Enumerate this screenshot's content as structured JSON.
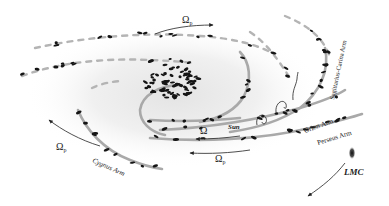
{
  "diagram": {
    "labels": {
      "omega_p_top": "Ω",
      "omega_p_top_sub": "p",
      "omega_p_left": "Ω",
      "omega_p_left_sub": "p",
      "omega_p_bottom": "Ω",
      "omega_p_bottom_sub": "p",
      "omega": "Ω",
      "sun": "Sun",
      "orion_arm": "Orion Arm",
      "perseus_arm": "Perseus Arm",
      "sagittarius_carina_arm": "Sagittarius-Carina Arm",
      "cygnus_arm": "Cygnus Arm",
      "lmc": "LMC"
    },
    "colors": {
      "arm": "#a9a9a9",
      "clusters": "#151515",
      "text": "#222222",
      "bulge_center": "#e6e6e6"
    }
  }
}
